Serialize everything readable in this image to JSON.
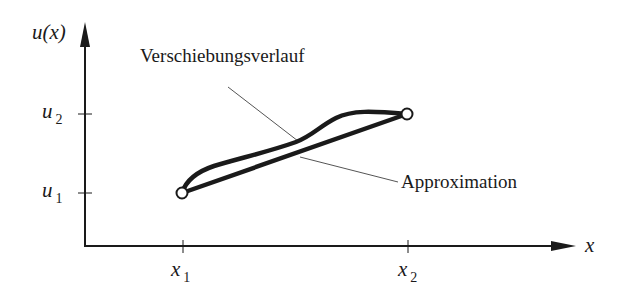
{
  "diagram": {
    "type": "displacement-approximation-plot",
    "axes": {
      "y_label": "u(x)",
      "x_label": "x",
      "y_ticks": [
        {
          "symbol": "u",
          "subscript": "2"
        },
        {
          "symbol": "u",
          "subscript": "1"
        }
      ],
      "x_ticks": [
        {
          "symbol": "x",
          "subscript": "1"
        },
        {
          "symbol": "x",
          "subscript": "2"
        }
      ]
    },
    "nodes": [
      {
        "name": "node-1",
        "x": "x1",
        "u": "u1"
      },
      {
        "name": "node-2",
        "x": "x2",
        "u": "u2"
      }
    ],
    "curves": [
      {
        "name": "Verschiebungsverlauf",
        "kind": "curved displacement path"
      },
      {
        "name": "Approximation",
        "kind": "linear approximation between nodes"
      }
    ],
    "annotations": {
      "displacement": "Verschiebungsverlauf",
      "approximation": "Approximation"
    },
    "colors": {
      "ink": "#1a1a1a",
      "leader": "#555555",
      "background": "#ffffff"
    }
  }
}
